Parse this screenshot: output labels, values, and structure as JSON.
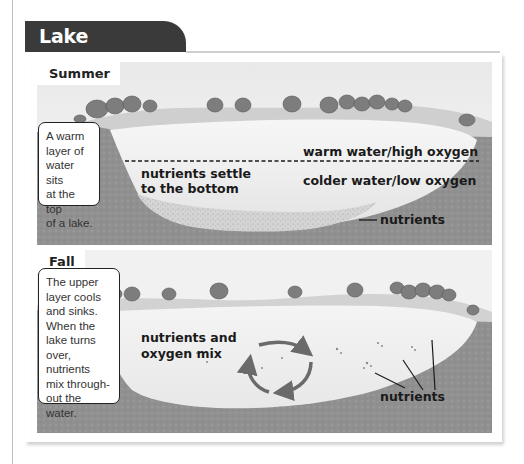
{
  "title": "Lake Turnover",
  "panels": {
    "summer": {
      "label": "Summer",
      "caption": "A warm layer of water sits at the top of a lake.",
      "caption_lines": [
        "A warm",
        "layer of",
        "water sits",
        "at the top",
        "of a lake."
      ],
      "labels": {
        "top_layer": "warm water/high oxygen",
        "bottom_layer": "colder water/low oxygen",
        "settle_line1": "nutrients settle",
        "settle_line2": "to the bottom",
        "nutrients": "nutrients"
      }
    },
    "fall": {
      "label": "Fall",
      "caption": "The upper layer cools and sinks. When the lake turns over, nutrients mix through-out the water.",
      "caption_lines": [
        "The upper",
        "layer cools",
        "and sinks.",
        "When the",
        "lake turns",
        "over, nutrients",
        "mix through-",
        "out the water."
      ],
      "labels": {
        "mix_line1": "nutrients and",
        "mix_line2": "oxygen mix",
        "nutrients": "nutrients"
      },
      "icons": [
        "circular-mixing-arrows-icon"
      ]
    }
  },
  "colors": {
    "title_bg": "#3a3a3a",
    "title_text": "#ffffff",
    "soil": "#8f8f8f",
    "water_top": "#f4f4f4",
    "water_bottom": "#e6e6e6",
    "shore": "#c9c9c9",
    "tree": "#7a7a7a"
  }
}
